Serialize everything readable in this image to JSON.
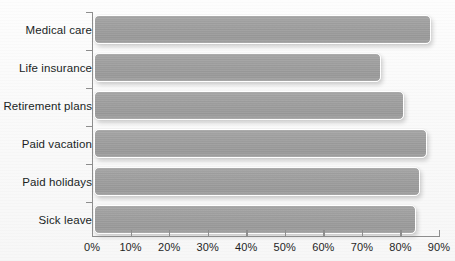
{
  "chart_data": {
    "type": "bar",
    "orientation": "horizontal",
    "title": "",
    "xlabel": "",
    "ylabel": "",
    "categories": [
      "Medical care",
      "Life insurance",
      "Retirement plans",
      "Paid vacation",
      "Paid holidays",
      "Sick leave"
    ],
    "values": [
      88,
      75,
      81,
      87,
      85,
      84
    ],
    "xlim": [
      0,
      90
    ],
    "xticks": [
      0,
      10,
      20,
      30,
      40,
      50,
      60,
      70,
      80,
      90
    ],
    "xticklabels": [
      "0%",
      "10%",
      "20%",
      "30%",
      "40%",
      "50%",
      "60%",
      "70%",
      "80%",
      "90%"
    ],
    "grid": false,
    "legend": null,
    "series": [
      {
        "name": "Percent of workers with access",
        "values": [
          88,
          75,
          81,
          87,
          85,
          84
        ]
      }
    ],
    "bar_color": "#9fa0a0",
    "bar_outline_color": "#ffffff",
    "axis_color": "#8e8e8e",
    "label_color": "#201f1f",
    "background_color": "#fafafa"
  }
}
